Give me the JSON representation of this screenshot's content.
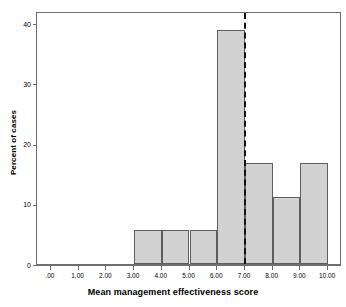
{
  "chart_data": {
    "type": "bar",
    "title": "",
    "subtitle": "",
    "xlabel": "Mean management effectiveness score",
    "ylabel": "Percent of cases",
    "xlim": [
      -0.5,
      10.5
    ],
    "ylim": [
      0,
      42
    ],
    "grid": false,
    "legend": null,
    "bar_style": {
      "fill": "#d2d2d2",
      "edge": "#5e5e5e"
    },
    "x_tick_labels": [
      ".00",
      "1.00",
      "2.00",
      "3.00",
      "4.00",
      "5.00",
      "6.00",
      "7.00",
      "8.00",
      "9.00",
      "10.00"
    ],
    "x_tick_values": [
      0,
      1,
      2,
      3,
      4,
      5,
      6,
      7,
      8,
      9,
      10
    ],
    "y_tick_labels": [
      "0",
      "10",
      "20",
      "30",
      "40"
    ],
    "y_tick_values": [
      0,
      10,
      20,
      30,
      40
    ],
    "bins": [
      {
        "label": "3.00-4.00",
        "x0": 3,
        "x1": 4,
        "value": 5.6
      },
      {
        "label": "4.00-5.00",
        "x0": 4,
        "x1": 5,
        "value": 5.6
      },
      {
        "label": "5.00-6.00",
        "x0": 5,
        "x1": 6,
        "value": 5.6
      },
      {
        "label": "6.00-7.00",
        "x0": 6,
        "x1": 7,
        "value": 38.9
      },
      {
        "label": "7.00-8.00",
        "x0": 7,
        "x1": 8,
        "value": 16.7
      },
      {
        "label": "8.00-9.00",
        "x0": 8,
        "x1": 9,
        "value": 11.1
      },
      {
        "label": "9.00-10.00",
        "x0": 9,
        "x1": 10,
        "value": 16.7
      }
    ],
    "annotations": [
      {
        "name": "threshold-line",
        "type": "vertical-dashed-line",
        "x": 7,
        "color": "#111111",
        "label": ""
      }
    ]
  }
}
